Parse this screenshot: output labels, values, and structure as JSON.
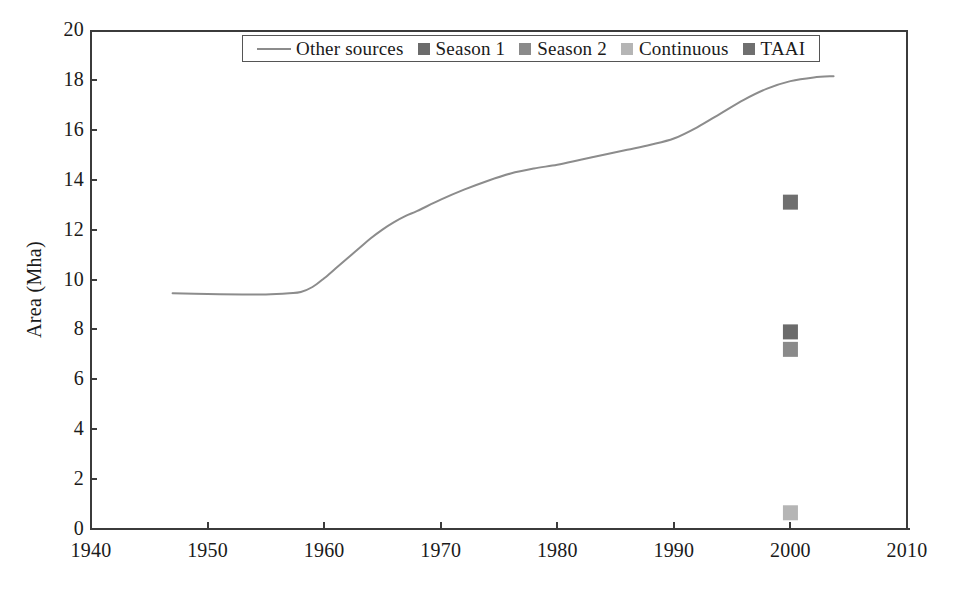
{
  "chart_data": {
    "type": "line",
    "title": "",
    "subtitle": "",
    "xlabel": "",
    "ylabel": "Area (Mha)",
    "xlim": [
      1940,
      2010
    ],
    "ylim": [
      0,
      20
    ],
    "xticks": [
      1940,
      1950,
      1960,
      1970,
      1980,
      1990,
      2000,
      2010
    ],
    "yticks": [
      0,
      2,
      4,
      6,
      8,
      10,
      12,
      14,
      16,
      18,
      20
    ],
    "grid": false,
    "legend_position": "top-center",
    "series": [
      {
        "name": "Other sources",
        "type": "line",
        "color": "#8c8c8c",
        "x": [
          1947,
          1950,
          1953,
          1955,
          1957,
          1958,
          1959,
          1960,
          1961,
          1962,
          1963,
          1964,
          1965,
          1966,
          1967,
          1968,
          1970,
          1972,
          1974,
          1976,
          1978,
          1980,
          1982,
          1984,
          1986,
          1988,
          1990,
          1992,
          1994,
          1996,
          1998,
          2000,
          2002,
          2003.7
        ],
        "values": [
          9.45,
          9.42,
          9.4,
          9.4,
          9.45,
          9.5,
          9.7,
          10.05,
          10.45,
          10.85,
          11.25,
          11.65,
          12.0,
          12.3,
          12.55,
          12.75,
          13.2,
          13.6,
          13.95,
          14.25,
          14.45,
          14.6,
          14.8,
          15.0,
          15.2,
          15.4,
          15.65,
          16.1,
          16.65,
          17.2,
          17.65,
          17.95,
          18.1,
          18.15
        ]
      },
      {
        "name": "Season 1",
        "type": "scatter",
        "color": "#6b6b6b",
        "points": [
          {
            "x": 2000,
            "y": 7.9
          }
        ]
      },
      {
        "name": "Season 2",
        "type": "scatter",
        "color": "#8a8a8a",
        "points": [
          {
            "x": 2000,
            "y": 7.2
          }
        ]
      },
      {
        "name": "Continuous",
        "type": "scatter",
        "color": "#b5b5b5",
        "points": [
          {
            "x": 2000,
            "y": 0.65
          }
        ]
      },
      {
        "name": "TAAI",
        "type": "scatter",
        "color": "#6f6f6f",
        "points": [
          {
            "x": 2000,
            "y": 13.1
          }
        ]
      }
    ]
  },
  "legend": {
    "entries": [
      {
        "label": "Other sources",
        "marker": "line",
        "color": "#8c8c8c"
      },
      {
        "label": "Season 1",
        "marker": "square",
        "color": "#6b6b6b"
      },
      {
        "label": "Season 2",
        "marker": "square",
        "color": "#8a8a8a"
      },
      {
        "label": "Continuous",
        "marker": "square",
        "color": "#b5b5b5"
      },
      {
        "label": "TAAI",
        "marker": "square",
        "color": "#6f6f6f"
      }
    ]
  },
  "axes": {
    "y_title": "Area (Mha)",
    "y_ticks": [
      "20",
      "18",
      "16",
      "14",
      "12",
      "10",
      "8",
      "6",
      "4",
      "2",
      "0"
    ],
    "x_ticks": [
      "1940",
      "1950",
      "1960",
      "1970",
      "1980",
      "1990",
      "2000",
      "2010"
    ]
  }
}
